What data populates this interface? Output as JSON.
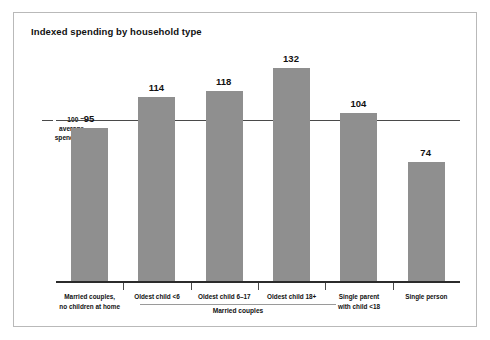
{
  "chart": {
    "title": "Indexed spending by household type",
    "axis_note_value": "100 =",
    "axis_note_line2": "average",
    "axis_note_line3": "spending",
    "group_label": "Married couples"
  },
  "chart_data": {
    "type": "bar",
    "title": "Indexed spending by household type",
    "xlabel": "",
    "ylabel": "",
    "ylim": [
      0,
      145
    ],
    "grid": false,
    "legend": "none",
    "reference_line": {
      "value": 100,
      "label": "100 = average spending"
    },
    "group_brackets": [
      {
        "label": "Married couples",
        "categories": [
          "Oldest child <6",
          "Oldest child 6–17",
          "Oldest child 18+"
        ]
      }
    ],
    "categories": [
      "Married couples,\nno children at home",
      "Oldest child <6",
      "Oldest child 6–17",
      "Oldest child 18+",
      "Single parent\nwith child <18",
      "Single person"
    ],
    "category_lines": [
      [
        "Married couples,",
        "no children at home"
      ],
      [
        "Oldest child <6"
      ],
      [
        "Oldest child 6–17"
      ],
      [
        "Oldest child 18+"
      ],
      [
        "Single parent",
        "with child <18"
      ],
      [
        "Single person"
      ]
    ],
    "values": [
      95,
      114,
      118,
      132,
      104,
      74
    ],
    "value_labels": [
      "95",
      "114",
      "118",
      "132",
      "104",
      "74"
    ],
    "bar_color": "#8f8f8f"
  }
}
